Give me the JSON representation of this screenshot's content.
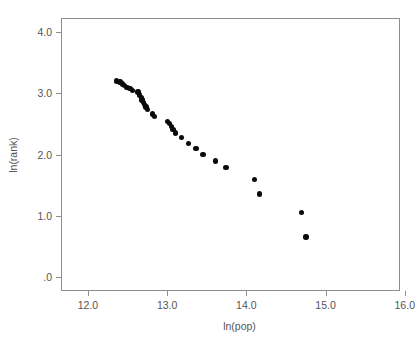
{
  "chart_data": {
    "type": "scatter",
    "title": "",
    "xlabel": "ln(pop)",
    "ylabel": "ln(rank)",
    "xlim": [
      11.66,
      15.94
    ],
    "ylim": [
      -0.23,
      4.23
    ],
    "xticks": [
      "12.0",
      "13.0",
      "14.0",
      "15.0",
      "16.0"
    ],
    "xtick_values": [
      12.0,
      13.0,
      14.0,
      15.0,
      16.0
    ],
    "yticks": [
      "4.0",
      "3.0",
      "2.0",
      "1.0",
      ".0"
    ],
    "ytick_values": [
      4.0,
      3.0,
      2.0,
      1.0,
      0.0
    ],
    "grid": false,
    "legend": null,
    "marker": "filled-circle",
    "marker_color": "#0b0b0b",
    "frame_color": "#8e8e8e",
    "background": "#ffffff",
    "x": [
      12.35,
      12.39,
      12.42,
      12.45,
      12.48,
      12.52,
      12.55,
      12.62,
      12.64,
      12.66,
      12.67,
      12.69,
      12.7,
      12.72,
      12.74,
      12.8,
      12.83,
      12.99,
      13.02,
      13.04,
      13.06,
      13.09,
      13.17,
      13.26,
      13.35,
      13.44,
      13.6,
      13.73,
      14.09,
      14.15,
      14.68,
      14.74,
      15.97
    ],
    "y": [
      3.22,
      3.2,
      3.17,
      3.14,
      3.11,
      3.09,
      3.06,
      3.04,
      2.99,
      2.95,
      2.91,
      2.87,
      2.83,
      2.79,
      2.75,
      2.68,
      2.64,
      2.56,
      2.52,
      2.47,
      2.42,
      2.37,
      2.29,
      2.2,
      2.11,
      2.02,
      1.91,
      1.8,
      1.61,
      1.37,
      1.07,
      0.67,
      -0.02
    ],
    "n_points": 33
  },
  "axes": {
    "x_title": "ln(pop)",
    "y_title": "ln(rank)"
  }
}
